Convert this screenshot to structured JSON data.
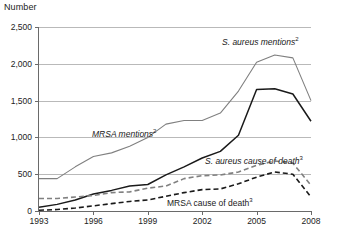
{
  "axis_title": "Number",
  "yaxis": {
    "label": "Number",
    "ticks": [
      "0",
      "500",
      "1,000",
      "1,500",
      "2,000",
      "2,500"
    ],
    "min": 0,
    "max": 2500,
    "step": 500
  },
  "xaxis": {
    "ticks": [
      "1993",
      "1996",
      "1999",
      "2002",
      "2005",
      "2008"
    ],
    "min": 1993,
    "max": 2008
  },
  "labels": {
    "s_aureus_mentions": "S. aureus mentions",
    "s_aureus_mentions_sup": "2",
    "mrsa_mentions": "MRSA mentions",
    "mrsa_mentions_sup": "2",
    "s_aureus_death": "S. aureus cause of death",
    "s_aureus_death_sup": "3",
    "mrsa_death": "MRSA cause of death",
    "mrsa_death_sup": "3"
  },
  "colors": {
    "gray_line": "#808080",
    "black_line": "#1a1a1a",
    "gridline": "#b9b9b9",
    "axis": "#6a6a6a",
    "background": "#ffffff"
  },
  "chart_data": {
    "type": "line",
    "title": "",
    "xlabel": "",
    "ylabel": "Number",
    "ylim": [
      0,
      2500
    ],
    "xlim": [
      1993,
      2008
    ],
    "grid": true,
    "legend": "inline-annotations",
    "x": [
      1993,
      1994,
      1995,
      1996,
      1997,
      1998,
      1999,
      2000,
      2001,
      2002,
      2003,
      2004,
      2005,
      2006,
      2007,
      2008
    ],
    "series": [
      {
        "name": "S. aureus mentions",
        "footnote": "2",
        "style": "solid",
        "color": "#808080",
        "values": [
          440,
          440,
          600,
          740,
          790,
          880,
          1000,
          1180,
          1230,
          1230,
          1330,
          1630,
          2020,
          2120,
          2080,
          1500
        ]
      },
      {
        "name": "MRSA mentions",
        "footnote": "2",
        "style": "solid",
        "color": "#1a1a1a",
        "values": [
          50,
          90,
          150,
          230,
          280,
          340,
          360,
          490,
          600,
          720,
          810,
          1030,
          1650,
          1660,
          1590,
          1220
        ]
      },
      {
        "name": "S. aureus cause of death",
        "footnote": "3",
        "style": "dashed",
        "color": "#808080",
        "values": [
          170,
          170,
          190,
          210,
          250,
          260,
          310,
          340,
          440,
          480,
          490,
          530,
          620,
          680,
          650,
          350
        ]
      },
      {
        "name": "MRSA cause of death",
        "footnote": "3",
        "style": "dashed",
        "color": "#1a1a1a",
        "values": [
          10,
          20,
          40,
          70,
          100,
          130,
          150,
          200,
          250,
          290,
          300,
          370,
          460,
          530,
          500,
          190
        ]
      }
    ]
  }
}
